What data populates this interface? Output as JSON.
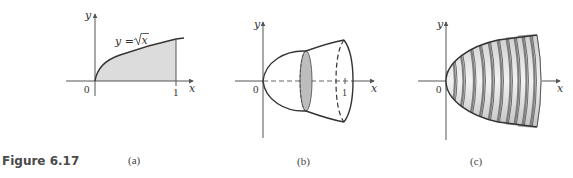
{
  "caption": {
    "figure_label": "Figure 6.17"
  },
  "colors": {
    "shade": "#dcdcdc",
    "disk_shade": "#bdbdbd",
    "curve": "#333333",
    "axis": "#555555",
    "disk_band": "#8f8f8f",
    "disk_face": "#e6e6e6"
  },
  "panels": [
    {
      "id": "a",
      "label": "(a)",
      "x_axis_label": "x",
      "y_axis_label": "y",
      "origin_label": "0",
      "tick_label": "1",
      "curve_label_lhs": "y = ",
      "curve_label_rhs": "x",
      "description": "Region under y = sqrt(x) from 0 to 1 shaded"
    },
    {
      "id": "b",
      "label": "(b)",
      "x_axis_label": "x",
      "y_axis_label": "y",
      "origin_label": "0",
      "tick_label": "1",
      "description": "Solid of revolution (paraboloid) with a shaded cross-sectional disk"
    },
    {
      "id": "c",
      "label": "(c)",
      "x_axis_label": "x",
      "y_axis_label": "y",
      "origin_label": "0",
      "description": "Solid approximated by a stack of thin disks",
      "disk_count": 11
    }
  ]
}
